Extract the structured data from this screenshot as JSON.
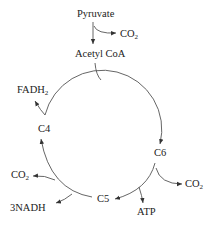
{
  "diagram": {
    "type": "krebs-cycle-simplified",
    "nodes": {
      "pyruvate": "Pyruvate",
      "acetyl_coa": "Acetyl CoA",
      "c6": "C6",
      "c5": "C5",
      "c4": "C4"
    },
    "products": {
      "co2_pyruvate": {
        "base": "CO",
        "sub": "2"
      },
      "co2_c6": {
        "base": "CO",
        "sub": "2"
      },
      "atp": "ATP",
      "co2_c5": {
        "base": "CO",
        "sub": "2"
      },
      "nadh": "3NADH",
      "fadh2": {
        "base": "FADH",
        "sub": "2"
      }
    },
    "edges": [
      {
        "from": "Pyruvate",
        "to": "Acetyl CoA",
        "byproduct": "CO2"
      },
      {
        "from": "Acetyl CoA",
        "to": "C6"
      },
      {
        "from": "C6",
        "to": "C5",
        "byproducts": [
          "CO2",
          "ATP"
        ]
      },
      {
        "from": "C5",
        "to": "C4",
        "byproducts": [
          "3NADH",
          "CO2"
        ]
      },
      {
        "from": "C4",
        "to": "Acetyl CoA",
        "byproduct": "FADH2"
      }
    ],
    "line_color": "#555555"
  }
}
